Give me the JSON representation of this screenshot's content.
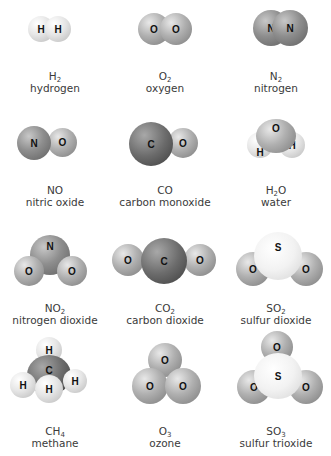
{
  "molecules": [
    {
      "formula_base": "H",
      "formula_sub": "2",
      "formula_tail": "",
      "name": "hydrogen",
      "atoms": [
        "H",
        "H"
      ]
    },
    {
      "formula_base": "O",
      "formula_sub": "2",
      "formula_tail": "",
      "name": "oxygen",
      "atoms": [
        "O",
        "O"
      ]
    },
    {
      "formula_base": "N",
      "formula_sub": "2",
      "formula_tail": "",
      "name": "nitrogen",
      "atoms": [
        "N",
        "N"
      ]
    },
    {
      "formula_base": "NO",
      "formula_sub": "",
      "formula_tail": "",
      "name": "nitric oxide",
      "atoms": [
        "N",
        "O"
      ]
    },
    {
      "formula_base": "CO",
      "formula_sub": "",
      "formula_tail": "",
      "name": "carbon monoxide",
      "atoms": [
        "C",
        "O"
      ]
    },
    {
      "formula_base": "H",
      "formula_sub": "2",
      "formula_tail": "O",
      "name": "water",
      "atoms": [
        "O",
        "H",
        "H"
      ]
    },
    {
      "formula_base": "NO",
      "formula_sub": "2",
      "formula_tail": "",
      "name": "nitrogen dioxide",
      "atoms": [
        "N",
        "O",
        "O"
      ]
    },
    {
      "formula_base": "CO",
      "formula_sub": "2",
      "formula_tail": "",
      "name": "carbon dioxide",
      "atoms": [
        "O",
        "C",
        "O"
      ]
    },
    {
      "formula_base": "SO",
      "formula_sub": "2",
      "formula_tail": "",
      "name": "sulfur dioxide",
      "atoms": [
        "S",
        "O",
        "O"
      ]
    },
    {
      "formula_base": "CH",
      "formula_sub": "4",
      "formula_tail": "",
      "name": "methane",
      "atoms": [
        "H",
        "C",
        "H",
        "H",
        "H"
      ]
    },
    {
      "formula_base": "O",
      "formula_sub": "3",
      "formula_tail": "",
      "name": "ozone",
      "atoms": [
        "O",
        "O",
        "O"
      ]
    },
    {
      "formula_base": "SO",
      "formula_sub": "3",
      "formula_tail": "",
      "name": "sulfur trioxide",
      "atoms": [
        "O",
        "S",
        "O",
        "O"
      ]
    }
  ]
}
